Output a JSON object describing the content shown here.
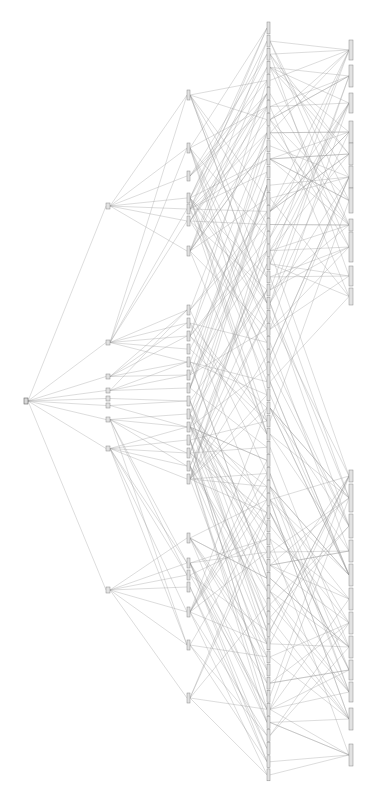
{
  "diagram": {
    "type": "layered-tree-graph",
    "orientation": "left-to-right (rotated labels)",
    "colors": {
      "edge": "#9a9a9a",
      "node_fill": "#e2e2e2",
      "node_stroke": "#8a8a8a",
      "background": "#ffffff"
    },
    "labels_legible": false,
    "columns": [
      {
        "level": 0,
        "x": 24,
        "node_w": 4,
        "nodes": [
          {
            "y": 398,
            "h": 6
          }
        ]
      },
      {
        "level": 1,
        "x": 106,
        "node_w": 4,
        "nodes": [
          {
            "y": 203,
            "h": 6
          },
          {
            "y": 340,
            "h": 5
          },
          {
            "y": 374,
            "h": 5
          },
          {
            "y": 388,
            "h": 5
          },
          {
            "y": 396,
            "h": 5
          },
          {
            "y": 403,
            "h": 5
          },
          {
            "y": 417,
            "h": 5
          },
          {
            "y": 446,
            "h": 5
          },
          {
            "y": 587,
            "h": 6
          }
        ]
      },
      {
        "level": 2,
        "x": 187,
        "node_w": 3,
        "nodes": [
          {
            "y": 90,
            "h": 10
          },
          {
            "y": 143,
            "h": 10
          },
          {
            "y": 171,
            "h": 10
          },
          {
            "y": 193,
            "h": 10
          },
          {
            "y": 204,
            "h": 10
          },
          {
            "y": 216,
            "h": 10
          },
          {
            "y": 246,
            "h": 10
          },
          {
            "y": 305,
            "h": 10
          },
          {
            "y": 318,
            "h": 10
          },
          {
            "y": 331,
            "h": 10
          },
          {
            "y": 344,
            "h": 10
          },
          {
            "y": 357,
            "h": 10
          },
          {
            "y": 370,
            "h": 10
          },
          {
            "y": 383,
            "h": 10
          },
          {
            "y": 396,
            "h": 10
          },
          {
            "y": 409,
            "h": 10
          },
          {
            "y": 422,
            "h": 10
          },
          {
            "y": 435,
            "h": 10
          },
          {
            "y": 448,
            "h": 10
          },
          {
            "y": 461,
            "h": 10
          },
          {
            "y": 474,
            "h": 10
          },
          {
            "y": 533,
            "h": 10
          },
          {
            "y": 558,
            "h": 10
          },
          {
            "y": 570,
            "h": 10
          },
          {
            "y": 582,
            "h": 10
          },
          {
            "y": 607,
            "h": 10
          },
          {
            "y": 640,
            "h": 10
          },
          {
            "y": 693,
            "h": 10
          }
        ]
      },
      {
        "level": 3,
        "x": 267,
        "node_w": 3,
        "span": [
          22,
          782
        ],
        "count": 58
      },
      {
        "level": 4,
        "x": 349,
        "node_w": 4,
        "nodes": [
          {
            "y": 40,
            "h": 20
          },
          {
            "y": 65,
            "h": 22
          },
          {
            "y": 93,
            "h": 20
          },
          {
            "y": 121,
            "h": 22
          },
          {
            "y": 143,
            "h": 22
          },
          {
            "y": 166,
            "h": 22
          },
          {
            "y": 188,
            "h": 25
          },
          {
            "y": 219,
            "h": 12
          },
          {
            "y": 232,
            "h": 30
          },
          {
            "y": 266,
            "h": 20
          },
          {
            "y": 288,
            "h": 17
          },
          {
            "y": 470,
            "h": 12
          },
          {
            "y": 484,
            "h": 28
          },
          {
            "y": 514,
            "h": 24
          },
          {
            "y": 540,
            "h": 22
          },
          {
            "y": 564,
            "h": 22
          },
          {
            "y": 588,
            "h": 22
          },
          {
            "y": 612,
            "h": 22
          },
          {
            "y": 636,
            "h": 22
          },
          {
            "y": 660,
            "h": 20
          },
          {
            "y": 682,
            "h": 20
          },
          {
            "y": 708,
            "h": 22
          },
          {
            "y": 744,
            "h": 22
          }
        ]
      }
    ],
    "edge_density": {
      "level0_to_1": "all",
      "level1_to_2": "groups",
      "level2_to_3": "dense",
      "level3_to_4": "dense"
    }
  }
}
